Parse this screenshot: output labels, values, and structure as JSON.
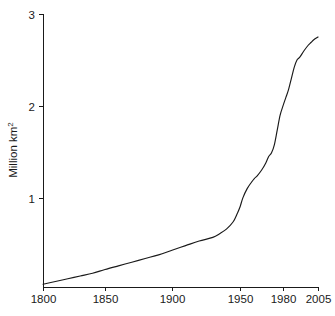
{
  "chart_data": {
    "type": "line",
    "title": "",
    "subtitle": "",
    "xlabel": "",
    "ylabel": "Million km2",
    "ylabel_text": "Million km",
    "ylabel_superscript": "2",
    "xlim": [
      1800,
      2005
    ],
    "ylim": [
      0,
      3
    ],
    "grid": false,
    "legend": null,
    "line_color": "#1a1a1a",
    "background_color": "#ffffff",
    "x_ticks": [
      1800,
      1850,
      1900,
      1950,
      1980,
      2005
    ],
    "x_tick_labels": [
      "1800",
      "1850",
      "1900",
      "1950",
      "1980",
      "2005"
    ],
    "y_ticks": [
      1,
      2,
      3
    ],
    "y_tick_labels": [
      "1",
      "2",
      "3"
    ],
    "series": [
      {
        "name": "Area",
        "x": [
          1800,
          1810,
          1820,
          1830,
          1840,
          1850,
          1860,
          1870,
          1880,
          1890,
          1900,
          1910,
          1920,
          1930,
          1935,
          1940,
          1945,
          1948,
          1950,
          1952,
          1955,
          1958,
          1960,
          1962,
          1965,
          1968,
          1970,
          1972,
          1974,
          1976,
          1978,
          1980,
          1982,
          1984,
          1986,
          1988,
          1990,
          1992,
          1995,
          1998,
          2000,
          2002,
          2005
        ],
        "values": [
          0.06,
          0.09,
          0.12,
          0.15,
          0.18,
          0.22,
          0.26,
          0.3,
          0.34,
          0.38,
          0.43,
          0.48,
          0.53,
          0.57,
          0.61,
          0.66,
          0.74,
          0.83,
          0.9,
          1.0,
          1.1,
          1.17,
          1.21,
          1.24,
          1.3,
          1.38,
          1.45,
          1.49,
          1.58,
          1.74,
          1.9,
          2.0,
          2.09,
          2.18,
          2.3,
          2.42,
          2.5,
          2.53,
          2.6,
          2.66,
          2.69,
          2.72,
          2.75
        ]
      }
    ]
  },
  "geometry": {
    "plot_left": 43,
    "plot_right": 318,
    "plot_bottom": 287,
    "plot_top": 14,
    "y_value_at_top": 3,
    "y_value_at_bottom": 0.03
  }
}
